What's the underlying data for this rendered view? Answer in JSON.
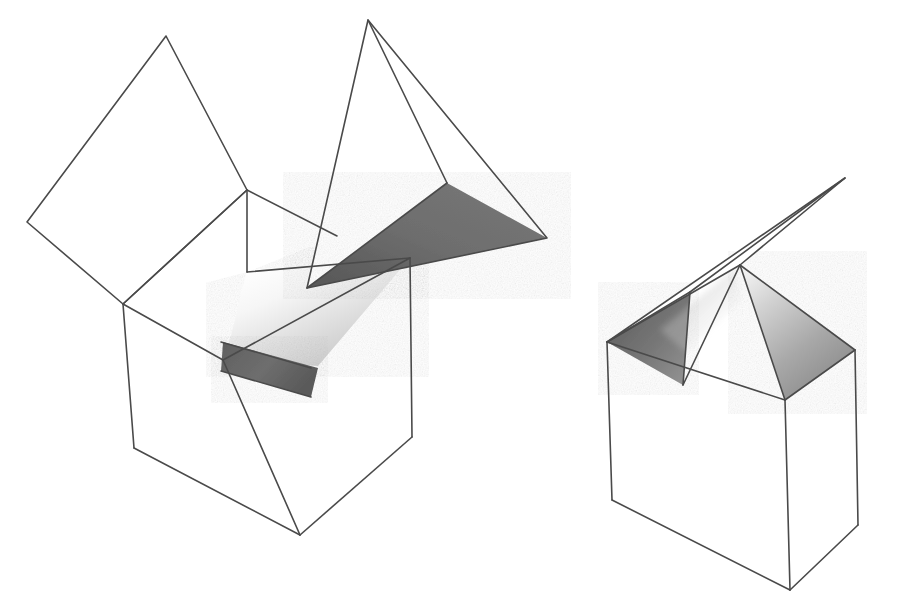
{
  "scene": {
    "title": "Two line-drawn open boxes with folded lid flaps",
    "background_color": "#ffffff",
    "stroke_color": "#4a4a4a",
    "width": 919,
    "height": 612,
    "shading": {
      "dark_gray": "#6b6b6b",
      "mid_gray": "#9a9a9a",
      "light_gray": "#d8d8d8",
      "pale_gray": "#f0f0f0",
      "white": "#ffffff"
    }
  },
  "objects": [
    {
      "id": "left-box",
      "name": "open-box-with-raised-lid-and-wedge",
      "description": "Cube drawn in perspective with its top opened; a large quadrilateral lid flap folds up to the left and a dark tetrahedral wedge flap projects up to the right.",
      "parts": [
        {
          "id": "left-box-lid-flap",
          "name": "open-lid-flap-quadrilateral",
          "fill": "#ffffff",
          "points": "27,222 166,36 247,190 123,304"
        },
        {
          "id": "left-box-rim-back-left",
          "name": "rim-back-left-edge-face",
          "fill": "#ffffff",
          "points": "123,304 247,190 337,238 247,270"
        },
        {
          "id": "left-box-interior-wall",
          "name": "interior-wall-shaded",
          "fill": "gradient-interior",
          "points": "247,270 410,258 318,366 225,360"
        },
        {
          "id": "left-box-interior-floor",
          "name": "interior-floor-dark-strip",
          "fill": "#6b6b6b",
          "points": "225,342 318,366 310,395 222,371"
        },
        {
          "id": "left-box-front-left-face",
          "name": "box-front-left-face",
          "fill": "#ffffff",
          "points": "123,304 225,360 300,535 134,448"
        },
        {
          "id": "left-box-front-right-face",
          "name": "box-front-right-face",
          "fill": "#ffffff",
          "points": "225,360 410,258 412,437 300,535"
        },
        {
          "id": "left-box-wedge-dark",
          "name": "wedge-flap-dark-triangle",
          "fill": "#6b6b6b",
          "points": "307,288 447,183 547,238"
        },
        {
          "id": "left-box-wedge-white-left",
          "name": "wedge-flap-white-left-face",
          "fill": "#ffffff",
          "points": "307,288 368,20 447,183"
        },
        {
          "id": "left-box-wedge-white-right",
          "name": "wedge-flap-white-right-face",
          "fill": "#ffffff",
          "points": "368,20 447,183 547,238"
        }
      ],
      "vertices": {
        "lid_far_left": [
          27,
          222
        ],
        "lid_top": [
          166,
          36
        ],
        "rim_back": [
          247,
          190
        ],
        "rim_left": [
          123,
          304
        ],
        "rim_front_center": [
          225,
          360
        ],
        "rim_right": [
          410,
          258
        ],
        "body_bottom_left": [
          134,
          448
        ],
        "body_bottom_center": [
          300,
          535
        ],
        "body_bottom_right": [
          412,
          437
        ],
        "wedge_apex_top": [
          368,
          20
        ],
        "wedge_fold_point": [
          307,
          288
        ],
        "wedge_mid": [
          447,
          183
        ],
        "wedge_tip_right": [
          547,
          238
        ]
      }
    },
    {
      "id": "right-box",
      "name": "open-box-with-two-folded-triangular-flaps",
      "description": "Smaller cube in perspective; two triangular lid flaps stand up from the rim forming a peak, with a long thin flap angling up to the upper right.",
      "parts": [
        {
          "id": "right-box-flap-left-dark",
          "name": "left-triangular-flap-dark",
          "fill": "gradient-dark-left",
          "points": "607,342 690,290 683,385"
        },
        {
          "id": "right-box-flap-right-shaded",
          "name": "right-triangular-flap-shaded",
          "fill": "gradient-shaded-right",
          "points": "740,265 855,350 785,400"
        },
        {
          "id": "right-box-flap-white-center",
          "name": "center-white-flap",
          "fill": "#ffffff",
          "points": "683,385 740,265 785,400"
        },
        {
          "id": "right-box-thin-flap",
          "name": "thin-raised-flap",
          "fill": "#ffffff",
          "points": "607,342 845,178 740,265"
        },
        {
          "id": "right-box-front-left-face",
          "name": "box-front-left-face",
          "fill": "#ffffff",
          "points": "607,342 785,400 790,590 612,500"
        },
        {
          "id": "right-box-front-right-face",
          "name": "box-front-right-face",
          "fill": "#ffffff",
          "points": "785,400 855,350 858,525 790,590"
        }
      ],
      "vertices": {
        "rim_left": [
          607,
          342
        ],
        "rim_back_peak": [
          740,
          265
        ],
        "rim_right": [
          855,
          350
        ],
        "rim_front_center": [
          785,
          400
        ],
        "flap_left_tip": [
          690,
          290
        ],
        "flap_fold_left": [
          683,
          385
        ],
        "thin_flap_tip": [
          845,
          178
        ],
        "body_bottom_left": [
          612,
          500
        ],
        "body_bottom_center": [
          790,
          590
        ],
        "body_bottom_right": [
          858,
          525
        ]
      }
    }
  ]
}
